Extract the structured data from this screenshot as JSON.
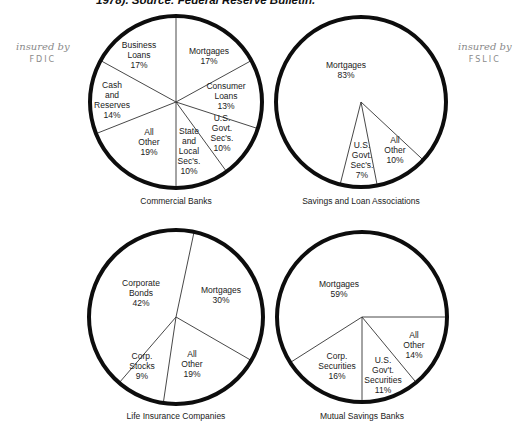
{
  "header": {
    "caption_fragment": "1978). Source: Federal Reserve Bulletin."
  },
  "annotations": {
    "left": {
      "line1": "insured by",
      "line2": "FDIC"
    },
    "right": {
      "line1": "insured by",
      "line2": "FSLIC"
    }
  },
  "chart_data": [
    {
      "type": "pie",
      "title": "Commercial Banks",
      "categories": [
        "Mortgages",
        "Consumer Loans",
        "U.S. Govt. Sec's.",
        "State and Local Sec's.",
        "All Other",
        "Cash and Reserves",
        "Business Loans"
      ],
      "values": [
        17,
        13,
        10,
        10,
        19,
        14,
        17
      ],
      "labels": [
        "Mortgages\n17%",
        "Consumer\nLoans\n13%",
        "U.S.\nGovt.\nSec's.\n10%",
        "State\nand\nLocal\nSec's.\n10%",
        "All\nOther\n19%",
        "Cash and\nReserves\n14%",
        "Business\nLoans\n17%"
      ],
      "start_angle_deg": 0,
      "annotation": "insured by FDIC"
    },
    {
      "type": "pie",
      "title": "Savings and Loan Associations",
      "categories": [
        "All Other",
        "U.S. Govt. Sec's.",
        "Mortgages"
      ],
      "values": [
        10,
        7,
        83
      ],
      "labels": [
        "All\nOther\n10%",
        "U.S.\nGovt.\nSec's.\n7%",
        "Mortgages\n83%"
      ],
      "start_angle_deg": 133,
      "annotation": "insured by FSLIC"
    },
    {
      "type": "pie",
      "title": "Life Insurance Companies",
      "categories": [
        "Mortgages",
        "All Other",
        "Corp. Stocks",
        "Corporate Bonds"
      ],
      "values": [
        30,
        19,
        9,
        42
      ],
      "labels": [
        "Mortgages\n30%",
        "All\nOther\n19%",
        "Corp.\nStocks\n9%",
        "Corporate\nBonds\n42%"
      ],
      "start_angle_deg": 12
    },
    {
      "type": "pie",
      "title": "Mutual Savings Banks",
      "categories": [
        "All Other",
        "U.S. Gov't. Securities",
        "Corp. Securities",
        "Mortgages"
      ],
      "values": [
        14,
        11,
        16,
        59
      ],
      "labels": [
        "All\nOther\n14%",
        "U.S.\nGov't.\nSecurities\n11%",
        "Corp.\nSecurities\n16%",
        "Mortgages\n59%"
      ],
      "start_angle_deg": 90
    }
  ],
  "layout": {
    "pies": [
      {
        "cx": 176,
        "cy": 102,
        "r": 86,
        "title_y": 196,
        "label_pos": [
          [
            209,
            56
          ],
          [
            226,
            96
          ],
          [
            222,
            133
          ],
          [
            189,
            151
          ],
          [
            149,
            142
          ],
          [
            112,
            100
          ],
          [
            139,
            55
          ]
        ]
      },
      {
        "cx": 361,
        "cy": 102,
        "r": 85,
        "title_y": 196,
        "label_pos": [
          [
            395,
            150
          ],
          [
            362,
            160
          ],
          [
            346,
            70
          ]
        ]
      },
      {
        "cx": 176,
        "cy": 317,
        "r": 87,
        "title_y": 411,
        "label_pos": [
          [
            221,
            295
          ],
          [
            192,
            364
          ],
          [
            142,
            366
          ],
          [
            141,
            293
          ]
        ]
      },
      {
        "cx": 362,
        "cy": 317,
        "r": 85,
        "title_y": 411,
        "label_pos": [
          [
            414,
            345
          ],
          [
            383,
            375
          ],
          [
            337,
            366
          ],
          [
            339,
            289
          ]
        ]
      }
    ]
  }
}
